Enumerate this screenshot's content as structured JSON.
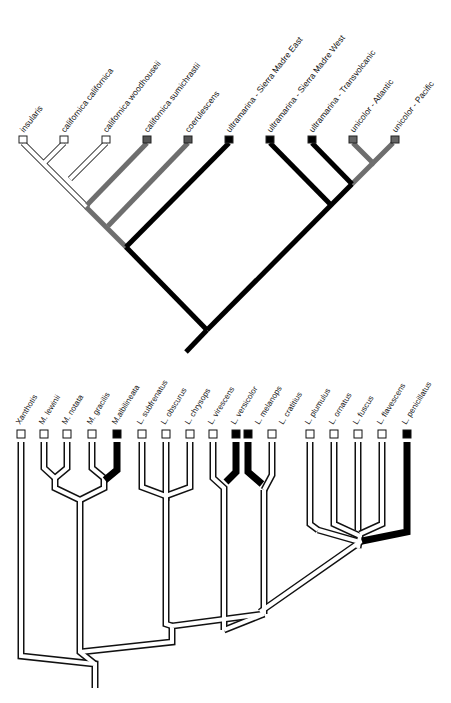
{
  "figure": {
    "top_tree": {
      "name": "Aphelocoma scrub/Mexican jay phylogeny",
      "colors": {
        "white_branch": "#ffffff",
        "gray_branch": "#6e6e6e",
        "black_branch": "#000000",
        "outline": "#222222"
      },
      "taxa": [
        {
          "label": "insularis",
          "state": "white"
        },
        {
          "label": "californica californica",
          "state": "white"
        },
        {
          "label": "californica woodhouseii",
          "state": "white"
        },
        {
          "label": "californica sumichrastii",
          "state": "gray"
        },
        {
          "label": "coerulescens",
          "state": "gray"
        },
        {
          "label": "ultramarina - Sierra Madre East",
          "state": "black"
        },
        {
          "label": "ultramarina - Sierra Madre West",
          "state": "black"
        },
        {
          "label": "ultramarina - Transvolcanic",
          "state": "black"
        },
        {
          "label": "unicolor - Atlantic",
          "state": "gray"
        },
        {
          "label": "unicolor - Pacific",
          "state": "gray"
        }
      ]
    },
    "bottom_tree": {
      "name": "Malurus / Lichenostomus phylogeny",
      "colors": {
        "white_branch": "#ffffff",
        "black_branch": "#000000",
        "outline": "#111111"
      },
      "taxa": [
        {
          "label": "Xanthotis",
          "state": "white"
        },
        {
          "label": "M. lewinii",
          "state": "white"
        },
        {
          "label": "M. notata",
          "state": "white"
        },
        {
          "label": "M. gracilis",
          "state": "white"
        },
        {
          "label": "M.albilineata",
          "state": "black"
        },
        {
          "label": "L. subfrenatus",
          "state": "white"
        },
        {
          "label": "L. obscurus",
          "state": "white"
        },
        {
          "label": "L. chrysops",
          "state": "white"
        },
        {
          "label": "L. virescens",
          "state": "white"
        },
        {
          "label": "L. versicolor",
          "state": "black"
        },
        {
          "label": "L. melanops",
          "state": "black"
        },
        {
          "label": "L. cratitius",
          "state": "white"
        },
        {
          "label": "L. plumulus",
          "state": "white"
        },
        {
          "label": "L. ornatus",
          "state": "white"
        },
        {
          "label": "L. fuscus",
          "state": "white"
        },
        {
          "label": "L. flavescens",
          "state": "white"
        },
        {
          "label": "L. penicillatus",
          "state": "black"
        }
      ]
    }
  }
}
